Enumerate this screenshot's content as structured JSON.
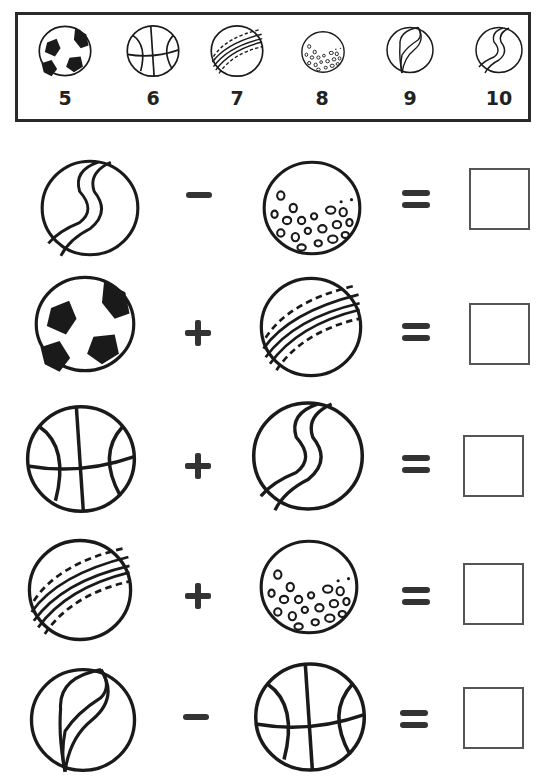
{
  "worksheet": {
    "key": {
      "items": [
        {
          "ball": "soccer-ball",
          "value": "5"
        },
        {
          "ball": "basketball",
          "value": "6"
        },
        {
          "ball": "cricket-ball",
          "value": "7"
        },
        {
          "ball": "golf-ball",
          "value": "8"
        },
        {
          "ball": "leaf-swirl-marble",
          "value": "9"
        },
        {
          "ball": "s-swirl-marble",
          "value": "10"
        }
      ]
    },
    "problems": [
      {
        "left": "s-swirl-marble",
        "operator": "minus",
        "right": "golf-ball",
        "equals": "=",
        "answer": ""
      },
      {
        "left": "soccer-ball",
        "operator": "plus",
        "right": "cricket-ball",
        "equals": "=",
        "answer": ""
      },
      {
        "left": "basketball",
        "operator": "plus",
        "right": "s-swirl-marble",
        "equals": "=",
        "answer": ""
      },
      {
        "left": "cricket-ball",
        "operator": "plus",
        "right": "golf-ball",
        "equals": "=",
        "answer": ""
      },
      {
        "left": "leaf-swirl-marble",
        "operator": "minus",
        "right": "basketball",
        "equals": "=",
        "answer": ""
      }
    ],
    "colors": {
      "ink": "#1a1a1a",
      "box_border": "#555555",
      "background": "#ffffff"
    }
  }
}
